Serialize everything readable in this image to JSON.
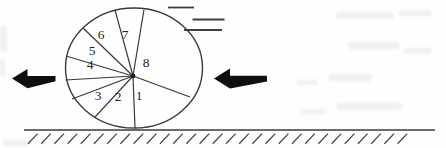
{
  "wheel": {
    "sector_labels": [
      "1",
      "2",
      "3",
      "4",
      "5",
      "6",
      "7",
      "8"
    ]
  },
  "icons": {
    "left_force_arrow": "bold-arrow-pointing-left",
    "right_force_arrow": "bold-arrow-pointing-left",
    "motion_lines": "speed-dashes",
    "ground": "hatched-ground-line",
    "hub": "axle-dot"
  },
  "colors": {
    "background": "#fefefe",
    "line": "#3a3a3a",
    "text": "#1f1f1f",
    "arrow": "#0f0f0f",
    "hatch": "#474747",
    "motion": "#3f3f3f",
    "noise": "#9a9a9a"
  }
}
